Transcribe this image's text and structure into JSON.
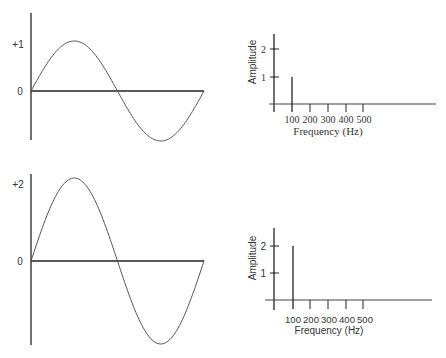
{
  "chart_data": [
    {
      "type": "line",
      "title": "",
      "description": "Sine wave, amplitude 1, one full period",
      "ylabel_ticks": [
        "+1",
        "0"
      ],
      "amplitude": 1,
      "periods": 1,
      "ylim": [
        -1,
        1
      ]
    },
    {
      "type": "bar",
      "title": "",
      "xlabel": "Frequency (Hz)",
      "ylabel": "Amplitude",
      "categories": [
        "100",
        "200",
        "300",
        "400",
        "500"
      ],
      "values": [
        1,
        0,
        0,
        0,
        0
      ],
      "y_ticks": [
        "1",
        "2"
      ],
      "ylim": [
        0,
        2.5
      ]
    },
    {
      "type": "line",
      "title": "",
      "description": "Sine wave, amplitude 2, one full period",
      "ylabel_ticks": [
        "+2",
        "0"
      ],
      "amplitude": 2,
      "periods": 1,
      "ylim": [
        -2,
        2
      ]
    },
    {
      "type": "bar",
      "title": "",
      "xlabel": "Frequency (Hz)",
      "ylabel": "Amplitude",
      "categories": [
        "100",
        "200",
        "300",
        "400",
        "500"
      ],
      "values": [
        2,
        0,
        0,
        0,
        0
      ],
      "y_ticks": [
        "1",
        "2"
      ],
      "ylim": [
        0,
        2.5
      ]
    }
  ],
  "top_wave": {
    "label_peak": "+1",
    "label_zero": "0"
  },
  "bottom_wave": {
    "label_peak": "+2",
    "label_zero": "0"
  },
  "top_spectrum": {
    "ylabel": "Amplitude",
    "tick_2": "2",
    "tick_1": "1",
    "x_ticks": [
      "100",
      "200",
      "300",
      "400",
      "500"
    ],
    "xlabel": "Frequency (Hz)"
  },
  "bottom_spectrum": {
    "ylabel": "Amplitude",
    "tick_2": "2",
    "tick_1": "1",
    "x_ticks": [
      "100",
      "200",
      "300",
      "400",
      "500"
    ],
    "xlabel": "Frequency (Hz)"
  }
}
